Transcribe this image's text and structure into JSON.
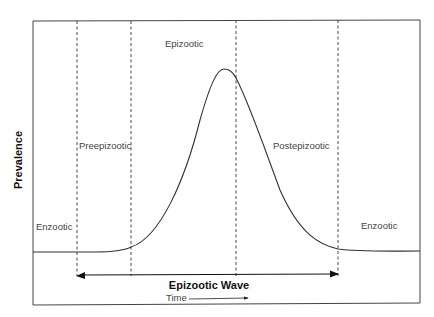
{
  "diagram": {
    "y_axis_label": "Prevalence",
    "phases": {
      "enzootic_left": "Enzootic",
      "preepizootic": "Preepizootic",
      "epizootic": "Epizootic",
      "postepizootic": "Postepizootic",
      "enzootic_right": "Enzootic"
    },
    "wave_label": "Epizootic Wave",
    "time_label": "Time",
    "colors": {
      "line": "#333333",
      "text": "#444444",
      "background": "#ffffff"
    }
  }
}
